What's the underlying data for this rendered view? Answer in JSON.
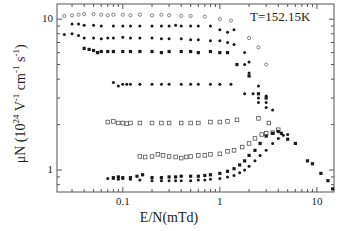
{
  "chart_data": {
    "type": "scatter",
    "title": "",
    "annotation": "T=152.15K",
    "xlabel": "E/N(mTd)",
    "ylabel": "μN (10^24 V^-1 cm^-1 s^-1)",
    "ylabel_parts": {
      "pre": "μN (10",
      "exp1": "24",
      "mid": " V",
      "exp2": "-1",
      "mid2": " cm",
      "exp3": "-1",
      "mid3": " s",
      "exp4": "-1",
      "post": ")"
    },
    "xscale": "log",
    "yscale": "log",
    "xlim": [
      0.021,
      15
    ],
    "ylim": [
      0.715,
      12.6
    ],
    "xticks": [
      {
        "value": 0.1,
        "label": "0.1"
      },
      {
        "value": 1,
        "label": "1"
      },
      {
        "value": 10,
        "label": "10"
      }
    ],
    "yticks": [
      {
        "value": 1,
        "label": "1"
      },
      {
        "value": 10,
        "label": "10"
      }
    ],
    "grid": false,
    "legend": null,
    "series": [
      {
        "name": "open-high",
        "marker": "open-circle",
        "points": [
          [
            0.025,
            10.5
          ],
          [
            0.03,
            10.6
          ],
          [
            0.035,
            10.7
          ],
          [
            0.04,
            10.8
          ],
          [
            0.05,
            10.8
          ],
          [
            0.06,
            10.7
          ],
          [
            0.07,
            10.6
          ],
          [
            0.08,
            10.7
          ],
          [
            0.1,
            10.7
          ],
          [
            0.12,
            10.6
          ],
          [
            0.15,
            10.7
          ],
          [
            0.2,
            10.6
          ],
          [
            0.25,
            10.7
          ],
          [
            0.3,
            10.6
          ],
          [
            0.4,
            10.5
          ],
          [
            0.5,
            10.5
          ],
          [
            0.7,
            10.4
          ],
          [
            1.0,
            10.0
          ],
          [
            1.3,
            9.8
          ],
          [
            2.0,
            7.5
          ],
          [
            2.5,
            6.5
          ],
          [
            3.0,
            5.0
          ]
        ]
      },
      {
        "name": "filled-1",
        "marker": "filled-circle",
        "points": [
          [
            0.03,
            9.3
          ],
          [
            0.035,
            9.3
          ],
          [
            0.04,
            9.1
          ],
          [
            0.05,
            9.1
          ],
          [
            0.06,
            9.0
          ],
          [
            0.08,
            9.0
          ],
          [
            0.1,
            9.0
          ],
          [
            0.12,
            9.0
          ],
          [
            0.15,
            9.0
          ],
          [
            0.2,
            9.0
          ],
          [
            0.25,
            9.0
          ],
          [
            0.3,
            9.0
          ],
          [
            0.35,
            9.1
          ],
          [
            0.4,
            9.0
          ],
          [
            0.5,
            9.0
          ],
          [
            0.6,
            9.0
          ],
          [
            0.8,
            9.0
          ],
          [
            1.0,
            8.5
          ],
          [
            1.2,
            8.2
          ],
          [
            1.4,
            8.5
          ],
          [
            1.8,
            6.0
          ],
          [
            2.0,
            5.2
          ],
          [
            2.5,
            3.6
          ],
          [
            3.0,
            3.1
          ]
        ]
      },
      {
        "name": "filled-2",
        "marker": "filled-circle",
        "points": [
          [
            0.025,
            7.9
          ],
          [
            0.03,
            8.0
          ],
          [
            0.035,
            7.8
          ],
          [
            0.04,
            7.5
          ],
          [
            0.05,
            7.5
          ],
          [
            0.06,
            7.4
          ],
          [
            0.07,
            7.5
          ],
          [
            0.08,
            7.5
          ],
          [
            0.1,
            7.6
          ],
          [
            0.12,
            7.5
          ],
          [
            0.15,
            7.5
          ],
          [
            0.2,
            7.5
          ],
          [
            0.25,
            7.4
          ],
          [
            0.3,
            7.4
          ],
          [
            0.4,
            7.4
          ],
          [
            0.5,
            7.3
          ],
          [
            0.6,
            7.3
          ],
          [
            0.8,
            7.2
          ],
          [
            1.0,
            7.2
          ],
          [
            1.2,
            7.0
          ],
          [
            1.4,
            6.8
          ],
          [
            1.8,
            5.0
          ],
          [
            2.0,
            4.4
          ],
          [
            2.5,
            3.0
          ],
          [
            3.0,
            2.8
          ]
        ]
      },
      {
        "name": "filled-3",
        "marker": "filled-square",
        "points": [
          [
            0.04,
            6.4
          ],
          [
            0.045,
            6.3
          ],
          [
            0.05,
            6.2
          ],
          [
            0.055,
            6.0
          ],
          [
            0.06,
            6.1
          ],
          [
            0.07,
            6.1
          ],
          [
            0.08,
            6.1
          ],
          [
            0.1,
            6.1
          ],
          [
            0.12,
            6.1
          ],
          [
            0.15,
            6.1
          ],
          [
            0.2,
            6.1
          ],
          [
            0.25,
            6.0
          ],
          [
            0.3,
            6.1
          ],
          [
            0.4,
            6.1
          ],
          [
            0.5,
            6.1
          ],
          [
            0.6,
            6.0
          ],
          [
            0.8,
            6.1
          ],
          [
            1.0,
            6.0
          ],
          [
            1.2,
            6.0
          ],
          [
            1.5,
            5.0
          ],
          [
            2.0,
            4.2
          ],
          [
            2.5,
            3.2
          ],
          [
            3.0,
            3.0
          ]
        ]
      },
      {
        "name": "filled-4",
        "marker": "filled-circle",
        "points": [
          [
            0.08,
            3.8
          ],
          [
            0.09,
            3.6
          ],
          [
            0.1,
            3.7
          ],
          [
            0.11,
            3.7
          ],
          [
            0.12,
            3.7
          ],
          [
            0.15,
            3.7
          ],
          [
            0.2,
            3.7
          ],
          [
            0.25,
            3.7
          ],
          [
            0.3,
            3.7
          ],
          [
            0.4,
            3.7
          ],
          [
            0.5,
            3.7
          ],
          [
            0.6,
            3.7
          ],
          [
            0.8,
            3.7
          ],
          [
            1.0,
            3.7
          ],
          [
            1.3,
            3.7
          ],
          [
            1.8,
            3.2
          ],
          [
            2.2,
            3.2
          ],
          [
            2.5,
            2.8
          ],
          [
            3.0,
            2.6
          ],
          [
            3.5,
            2.5
          ]
        ]
      },
      {
        "name": "open-square-1",
        "marker": "open-square",
        "points": [
          [
            0.07,
            2.08
          ],
          [
            0.08,
            2.1
          ],
          [
            0.09,
            2.05
          ],
          [
            0.1,
            2.05
          ],
          [
            0.11,
            2.03
          ],
          [
            0.12,
            2.05
          ],
          [
            0.15,
            2.05
          ],
          [
            0.2,
            2.05
          ],
          [
            0.25,
            2.05
          ],
          [
            0.3,
            2.05
          ],
          [
            0.4,
            2.05
          ],
          [
            0.5,
            2.05
          ],
          [
            0.6,
            2.05
          ],
          [
            0.8,
            2.08
          ],
          [
            1.0,
            2.08
          ],
          [
            1.2,
            2.1
          ],
          [
            1.5,
            2.15
          ],
          [
            2.5,
            2.2
          ],
          [
            3.2,
            2.05
          ]
        ]
      },
      {
        "name": "open-square-2",
        "marker": "open-square",
        "points": [
          [
            0.15,
            1.23
          ],
          [
            0.17,
            1.22
          ],
          [
            0.2,
            1.23
          ],
          [
            0.23,
            1.27
          ],
          [
            0.26,
            1.25
          ],
          [
            0.3,
            1.23
          ],
          [
            0.35,
            1.22
          ],
          [
            0.4,
            1.2
          ],
          [
            0.45,
            1.22
          ],
          [
            0.5,
            1.23
          ],
          [
            0.6,
            1.25
          ],
          [
            0.7,
            1.25
          ],
          [
            0.8,
            1.27
          ],
          [
            1.0,
            1.28
          ],
          [
            1.2,
            1.33
          ],
          [
            1.4,
            1.35
          ],
          [
            1.7,
            1.42
          ],
          [
            2.0,
            1.5
          ],
          [
            2.3,
            1.62
          ],
          [
            2.7,
            1.72
          ],
          [
            3.0,
            1.75
          ],
          [
            3.5,
            1.77
          ],
          [
            4.0,
            1.85
          ]
        ]
      },
      {
        "name": "filled-low-1",
        "marker": "filled-square",
        "points": [
          [
            0.08,
            0.89
          ],
          [
            0.09,
            0.9
          ],
          [
            0.1,
            0.89
          ],
          [
            0.12,
            0.89
          ],
          [
            0.14,
            0.91
          ],
          [
            0.16,
            0.93
          ],
          [
            0.2,
            0.89
          ],
          [
            0.25,
            0.89
          ],
          [
            0.3,
            0.9
          ],
          [
            0.35,
            0.9
          ],
          [
            0.4,
            0.91
          ],
          [
            0.5,
            0.91
          ],
          [
            0.6,
            0.91
          ],
          [
            0.7,
            0.92
          ],
          [
            0.8,
            0.93
          ],
          [
            1.0,
            0.95
          ],
          [
            1.2,
            0.98
          ],
          [
            1.4,
            1.02
          ],
          [
            1.6,
            1.08
          ],
          [
            1.8,
            1.15
          ],
          [
            2.0,
            1.25
          ],
          [
            2.3,
            1.35
          ],
          [
            2.6,
            1.5
          ],
          [
            3.0,
            1.68
          ],
          [
            3.5,
            1.75
          ],
          [
            4.0,
            1.8
          ],
          [
            4.3,
            1.75
          ],
          [
            5.0,
            1.6
          ],
          [
            6.0,
            1.5
          ],
          [
            8.0,
            1.15
          ],
          [
            9.0,
            1.1
          ],
          [
            11.0,
            0.95
          ],
          [
            13.0,
            0.85
          ],
          [
            14.5,
            0.75
          ]
        ]
      },
      {
        "name": "filled-low-2",
        "marker": "filled-circle",
        "points": [
          [
            0.07,
            0.88
          ],
          [
            0.08,
            0.88
          ],
          [
            0.09,
            0.87
          ],
          [
            0.1,
            0.88
          ],
          [
            0.12,
            0.87
          ],
          [
            0.15,
            0.86
          ],
          [
            0.2,
            0.85
          ],
          [
            0.25,
            0.85
          ],
          [
            0.3,
            0.85
          ],
          [
            0.35,
            0.85
          ],
          [
            0.4,
            0.85
          ],
          [
            0.5,
            0.85
          ],
          [
            0.6,
            0.86
          ],
          [
            0.7,
            0.86
          ],
          [
            0.8,
            0.87
          ],
          [
            1.0,
            0.88
          ],
          [
            1.2,
            0.9
          ],
          [
            1.4,
            0.92
          ],
          [
            1.6,
            0.96
          ],
          [
            1.8,
            1.0
          ],
          [
            2.0,
            1.06
          ],
          [
            2.3,
            1.15
          ],
          [
            2.6,
            1.25
          ],
          [
            3.0,
            1.35
          ],
          [
            3.5,
            1.5
          ],
          [
            4.0,
            1.62
          ],
          [
            4.5,
            1.7
          ],
          [
            5.0,
            1.72
          ]
        ]
      }
    ]
  },
  "layout": {
    "plot": {
      "left": 57,
      "top": 4,
      "right": 334,
      "bottom": 192
    },
    "color": "#1a1a1a"
  }
}
